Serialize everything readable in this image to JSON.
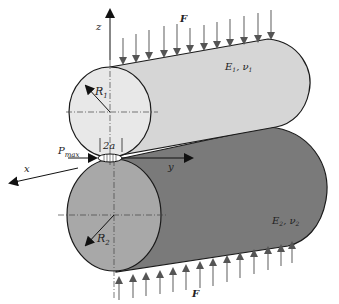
{
  "figure": {
    "labels": {
      "force_top": "F",
      "force_bottom": "F",
      "axis_z": "z",
      "axis_x": "x",
      "axis_y": "y",
      "radius_1": "R",
      "radius_1_sub": "1",
      "radius_2": "R",
      "radius_2_sub": "2",
      "material_1": "E",
      "material_1_sub": "1",
      "material_1_nu": "ν",
      "material_1_nu_sub": "1",
      "material_2": "E",
      "material_2_sub": "2",
      "material_2_nu": "ν",
      "material_2_nu_sub": "2",
      "contact_width": "2a",
      "pressure": "P",
      "pressure_sub": "max"
    },
    "colors": {
      "cylinder_1_body": "#d6d6d6",
      "cylinder_1_end": "#e8e8e8",
      "cylinder_2_body": "#7a7a7a",
      "cylinder_2_end": "#a8a8a8",
      "arrow": "#6e6e6e",
      "outline": "#1a1a1a"
    }
  }
}
